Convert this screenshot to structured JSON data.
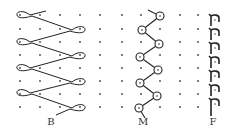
{
  "figure": {
    "type": "lapping-diagrams",
    "colors": {
      "stroke": "#222222",
      "dot": "#333333",
      "background": "#ffffff"
    },
    "panels": [
      {
        "id": "B",
        "label": "B",
        "label_x": 51,
        "label_y": 116
      },
      {
        "id": "M",
        "label": "M",
        "label_x": 143,
        "label_y": 116
      },
      {
        "id": "F",
        "label": "F",
        "label_x": 213,
        "label_y": 116
      }
    ]
  }
}
